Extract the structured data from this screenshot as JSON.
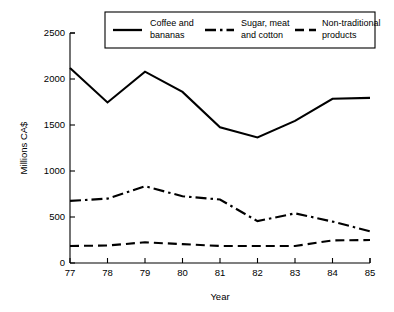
{
  "chart_data": {
    "type": "line",
    "title": "",
    "xlabel": "Year",
    "ylabel": "Millions CA$",
    "x": [
      "77",
      "78",
      "79",
      "80",
      "81",
      "82",
      "83",
      "84",
      "85"
    ],
    "xtick_labels": [
      "77",
      "78",
      "79",
      "80",
      "81",
      "82",
      "83",
      "84",
      "85"
    ],
    "ytick_labels": [
      "0",
      "500",
      "1000",
      "1500",
      "2000",
      "2500"
    ],
    "yticks": [
      0,
      500,
      1000,
      1500,
      2000,
      2500
    ],
    "ylim": [
      0,
      2500
    ],
    "xlim": [
      77,
      85
    ],
    "grid": false,
    "legend_position": "top",
    "series": [
      {
        "name": "Coffee and bananas",
        "label_lines": [
          "Coffee and",
          "bananas"
        ],
        "linestyle": "solid",
        "color": "#000000",
        "values": [
          2120,
          1745,
          2080,
          1860,
          1475,
          1365,
          1545,
          1785,
          1795
        ]
      },
      {
        "name": "Sugar, meat and cotton",
        "label_lines": [
          "Sugar, meat",
          "and cotton"
        ],
        "linestyle": "dashdot",
        "color": "#000000",
        "values": [
          675,
          700,
          835,
          725,
          690,
          455,
          540,
          450,
          345
        ]
      },
      {
        "name": "Non-traditional products",
        "label_lines": [
          "Non-traditional",
          "products"
        ],
        "linestyle": "dashed",
        "color": "#000000",
        "values": [
          185,
          190,
          225,
          205,
          185,
          185,
          185,
          245,
          250
        ]
      }
    ]
  },
  "axis": {
    "y_title": "Millions CA$",
    "x_title": "Year"
  }
}
